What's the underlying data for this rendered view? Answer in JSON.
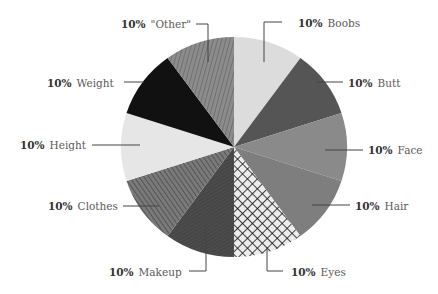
{
  "chart_data": {
    "type": "pie",
    "title": "",
    "start_angle_deg": 0,
    "direction": "clockwise",
    "slices": [
      {
        "label": "Boobs",
        "value": 10,
        "pct_label": "10%",
        "fill": "#dcdcdc",
        "pattern": "solid"
      },
      {
        "label": "Butt",
        "value": 10,
        "pct_label": "10%",
        "fill": "#555555",
        "pattern": "solid"
      },
      {
        "label": "Face",
        "value": 10,
        "pct_label": "10%",
        "fill": "#8a8a8a",
        "pattern": "solid"
      },
      {
        "label": "Hair",
        "value": 10,
        "pct_label": "10%",
        "fill": "#7e7e7e",
        "pattern": "solid"
      },
      {
        "label": "Eyes",
        "value": 10,
        "pct_label": "10%",
        "fill": "#e8e8e8",
        "pattern": "crosshatch"
      },
      {
        "label": "Makeup",
        "value": 10,
        "pct_label": "10%",
        "fill": "#4a4a4a",
        "pattern": "fine-diagonal"
      },
      {
        "label": "Clothes",
        "value": 10,
        "pct_label": "10%",
        "fill": "#6a6a6a",
        "pattern": "diagonal-stripes"
      },
      {
        "label": "Height",
        "value": 10,
        "pct_label": "10%",
        "fill": "#e6e6e6",
        "pattern": "solid"
      },
      {
        "label": "Weight",
        "value": 10,
        "pct_label": "10%",
        "fill": "#111111",
        "pattern": "solid"
      },
      {
        "label": "\"Other\"",
        "value": 10,
        "pct_label": "10%",
        "fill": "#7a7a7a",
        "pattern": "vertical-stripes"
      }
    ],
    "legend": "none (callout labels)",
    "colors": {
      "background": "#ffffff",
      "leader_line": "#444444",
      "label_text": "#5a5a5a",
      "pct_text": "#333333"
    }
  },
  "labels": {
    "boobs": {
      "pct": "10%",
      "name": "Boobs"
    },
    "butt": {
      "pct": "10%",
      "name": "Butt"
    },
    "face": {
      "pct": "10%",
      "name": "Face"
    },
    "hair": {
      "pct": "10%",
      "name": "Hair"
    },
    "eyes": {
      "pct": "10%",
      "name": "Eyes"
    },
    "makeup": {
      "pct": "10%",
      "name": "Makeup"
    },
    "clothes": {
      "pct": "10%",
      "name": "Clothes"
    },
    "height": {
      "pct": "10%",
      "name": "Height"
    },
    "weight": {
      "pct": "10%",
      "name": "Weight"
    },
    "other": {
      "pct": "10%",
      "name": "\"Other\""
    }
  }
}
